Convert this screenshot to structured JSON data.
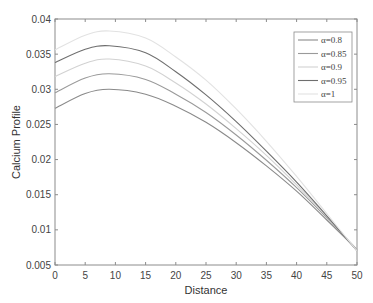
{
  "chart_data": {
    "type": "line",
    "title": "",
    "xlabel": "Distance",
    "ylabel": "Calcium Profile",
    "xlim": [
      0,
      50
    ],
    "ylim": [
      0.005,
      0.04
    ],
    "xticks": [
      0,
      5,
      10,
      15,
      20,
      25,
      30,
      35,
      40,
      45,
      50
    ],
    "xtick_labels": [
      "0",
      "5",
      "10",
      "15",
      "20",
      "25",
      "30",
      "35",
      "40",
      "45",
      "50"
    ],
    "yticks": [
      0.005,
      0.01,
      0.015,
      0.02,
      0.025,
      0.03,
      0.035,
      0.04
    ],
    "ytick_labels": [
      "0.005",
      "0.01",
      "0.015",
      "0.02",
      "0.025",
      "0.03",
      "0.035",
      "0.04"
    ],
    "grid": false,
    "legend_position": "upper right",
    "x": [
      0,
      5,
      9,
      15,
      20,
      25,
      30,
      35,
      40,
      45,
      50
    ],
    "series": [
      {
        "name": "α=0.8",
        "color": "#8a8a8a",
        "values": [
          0.0273,
          0.0294,
          0.03,
          0.0293,
          0.0276,
          0.0253,
          0.0224,
          0.0191,
          0.0155,
          0.0114,
          0.0072
        ]
      },
      {
        "name": "α=0.85",
        "color": "#9a9a9a",
        "values": [
          0.0295,
          0.0316,
          0.0322,
          0.0314,
          0.0293,
          0.0267,
          0.0235,
          0.0199,
          0.016,
          0.0117,
          0.0072
        ]
      },
      {
        "name": "α=0.9",
        "color": "#d2d2d2",
        "values": [
          0.0318,
          0.0337,
          0.0343,
          0.0333,
          0.0309,
          0.0279,
          0.0244,
          0.0206,
          0.0164,
          0.0119,
          0.0071
        ]
      },
      {
        "name": "α=0.95",
        "color": "#6e6e6e",
        "values": [
          0.0338,
          0.0357,
          0.0362,
          0.0352,
          0.0325,
          0.0292,
          0.0254,
          0.0212,
          0.0168,
          0.012,
          0.007
        ]
      },
      {
        "name": "α=1",
        "color": "#e2e2e2",
        "values": [
          0.0356,
          0.0377,
          0.0383,
          0.0373,
          0.0346,
          0.0313,
          0.0272,
          0.0226,
          0.0176,
          0.0123,
          0.007
        ]
      }
    ]
  },
  "caption": "(b) Profiles of calcium for different α"
}
